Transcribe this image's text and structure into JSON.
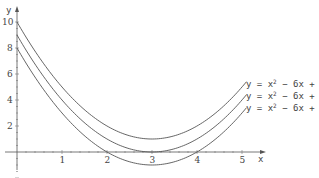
{
  "chart_data": {
    "type": "line",
    "title": "",
    "xlabel": "x",
    "ylabel": "y",
    "xlim": [
      -0.1,
      5.4
    ],
    "ylim": [
      -1.4,
      10.5
    ],
    "grid": false,
    "x_ticks": [
      "1",
      "2",
      "3",
      "4",
      "5"
    ],
    "y_ticks": [
      "2",
      "4",
      "6",
      "8",
      "10"
    ],
    "series": [
      {
        "name": "y = x² − 6x + 10",
        "a": 1,
        "b": -6,
        "c": 10,
        "x": [
          0,
          1,
          2,
          3,
          4,
          5
        ],
        "values": [
          10,
          5,
          2,
          1,
          2,
          5
        ]
      },
      {
        "name": "y = x² − 6x + 9",
        "a": 1,
        "b": -6,
        "c": 9,
        "x": [
          0,
          1,
          2,
          3,
          4,
          5
        ],
        "values": [
          9,
          4,
          1,
          0,
          1,
          4
        ]
      },
      {
        "name": "y = x² − 6x + 8",
        "a": 1,
        "b": -6,
        "c": 8,
        "x": [
          0,
          1,
          2,
          3,
          4,
          5
        ],
        "values": [
          8,
          3,
          0,
          -1,
          0,
          3
        ]
      }
    ],
    "labels": [
      {
        "text": "y = x",
        "sup": "2",
        "rest": " − 6x + 10"
      },
      {
        "text": "y = x",
        "sup": "2",
        "rest": " − 6x + 9"
      },
      {
        "text": "y = x",
        "sup": "2",
        "rest": " − 6x + 8"
      }
    ]
  }
}
